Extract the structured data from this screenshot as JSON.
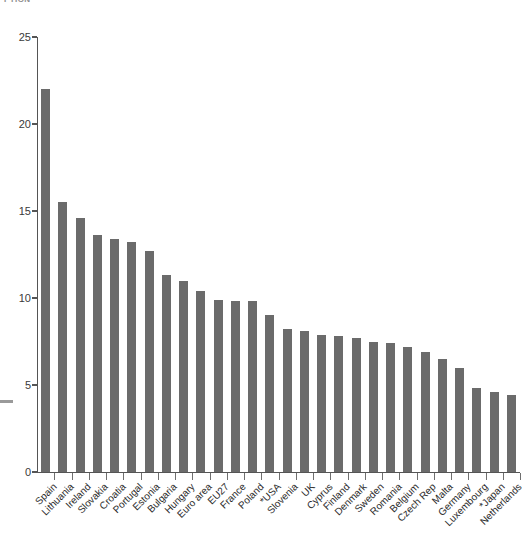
{
  "clipped_title": "PTION",
  "axis": {
    "y_ticks": [
      0,
      5,
      10,
      15,
      20,
      25
    ],
    "y_min": 0,
    "y_max": 25,
    "x_label": "",
    "y_label": ""
  },
  "chart_data": {
    "type": "bar",
    "title": "",
    "subtitle": "",
    "xlabel": "",
    "ylabel": "",
    "ylim": [
      0,
      25
    ],
    "grid": false,
    "legend": "none",
    "orientation": "vertical",
    "bar_color": "#6b6b6b",
    "categories": [
      "Spain",
      "Lithuania",
      "Ireland",
      "Slovakia",
      "Croatia",
      "Portugal",
      "Estonia",
      "Bulgaria",
      "Hungary",
      "Euro area",
      "EU27",
      "France",
      "Poland",
      "*USA",
      "Slovenia",
      "UK",
      "Cyprus",
      "Finland",
      "Denmark",
      "Sweden",
      "Romania",
      "Belgium",
      "Czech Rep",
      "Malta",
      "Germany",
      "Luxembourg",
      "*Japan",
      "Netherlands"
    ],
    "values": [
      22.0,
      15.5,
      14.6,
      13.6,
      13.4,
      13.2,
      12.7,
      11.3,
      11.0,
      10.4,
      9.9,
      9.8,
      9.8,
      9.0,
      8.2,
      8.1,
      7.9,
      7.8,
      7.7,
      7.5,
      7.4,
      7.2,
      6.9,
      6.5,
      6.0,
      4.8,
      4.6,
      4.4
    ],
    "value_unit": "percent"
  }
}
